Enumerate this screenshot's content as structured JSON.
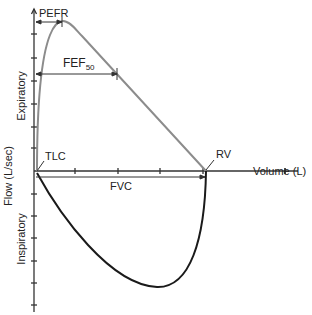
{
  "diagram": {
    "type": "flow-volume-loop",
    "axes": {
      "y_label": "Flow (L/sec)",
      "x_label": "Volume (L)",
      "upper_region_label": "Expiratory",
      "lower_region_label": "Inspiratory"
    },
    "annotations": {
      "pefr": "PEFR",
      "fef_main": "FEF",
      "fef_sub": "50",
      "tlc": "TLC",
      "rv": "RV",
      "fvc": "FVC"
    },
    "colors": {
      "axis": "#333333",
      "expiratory_curve": "#8c8c8c",
      "inspiratory_curve": "#1a1a1a",
      "text": "#222222"
    }
  }
}
